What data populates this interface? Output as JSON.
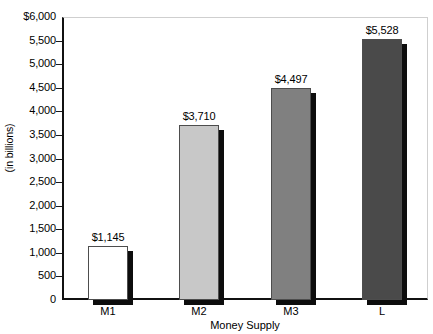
{
  "chart_data": {
    "type": "bar",
    "title": "",
    "xlabel": "Money Supply",
    "ylabel": "(in billions)",
    "categories": [
      "M1",
      "M2",
      "M3",
      "L"
    ],
    "values": [
      1145,
      3710,
      4497,
      5528
    ],
    "value_labels": [
      "$1,145",
      "$3,710",
      "$4,497",
      "$5,528"
    ],
    "bar_colors": [
      "#ffffff",
      "#c8c8c8",
      "#808080",
      "#4a4a4a"
    ],
    "ylim": [
      0,
      6000
    ],
    "ytick_values": [
      6000,
      5500,
      5000,
      4500,
      4000,
      3500,
      3000,
      2500,
      2000,
      1500,
      1000,
      500,
      0
    ],
    "ytick_labels": [
      "$6,000",
      "5,500",
      "5,000",
      "4,500",
      "4,000",
      "3,500",
      "3,000",
      "2,500",
      "2,000",
      "1,500",
      "1,000",
      "500",
      "0"
    ],
    "grid": false,
    "legend": "none",
    "bar_shadow_color": "#0d0d0d",
    "axis_color": "#111111"
  },
  "top_cropped_text": ""
}
